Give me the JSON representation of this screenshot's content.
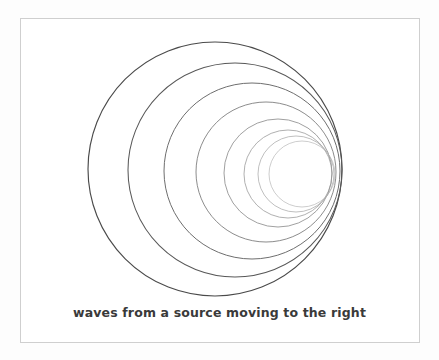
{
  "figure": {
    "caption": "waves from a source moving to the right",
    "title": "waves from a source moving to the right",
    "background_color": "#fdfdfd",
    "panel_color": "#ffffff",
    "border_color": "#cfcfcf",
    "caption_color": "#3a3a3a",
    "frame": {
      "x": 20,
      "y": 18,
      "width": 400,
      "height": 325
    }
  },
  "chart_data": {
    "type": "scatter",
    "title": "waves from a source moving to the right",
    "xlabel": "",
    "ylabel": "",
    "grid": false,
    "legend": "none",
    "xlim": [
      20,
      420
    ],
    "ylim": [
      18,
      343
    ],
    "series": [
      {
        "name": "wavefront-circles",
        "units": "pixels",
        "fields": [
          "cx",
          "cy",
          "r",
          "stroke_width",
          "stroke_color"
        ],
        "values": [
          [
            215,
            169,
            127,
            1.15,
            "#4a4a4a"
          ],
          [
            235,
            170,
            107,
            1.05,
            "#585858"
          ],
          [
            252,
            171,
            88,
            0.95,
            "#666666"
          ],
          [
            266,
            172,
            70,
            0.85,
            "#777777"
          ],
          [
            278,
            173,
            54,
            0.8,
            "#888888"
          ],
          [
            288,
            174,
            44,
            0.75,
            "#969696"
          ],
          [
            296,
            174,
            38,
            0.7,
            "#a4a4a4"
          ],
          [
            302,
            174,
            33,
            0.65,
            "#b2b2b2"
          ]
        ]
      }
    ],
    "annotations": [
      {
        "text": "waves from a source moving to the right",
        "x": 221,
        "y": 318,
        "align": "center"
      }
    ]
  }
}
